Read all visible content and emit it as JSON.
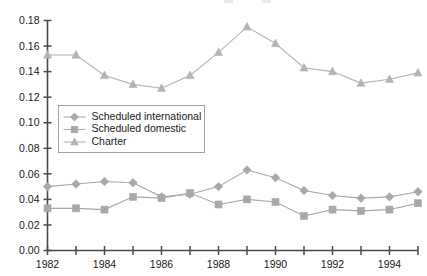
{
  "chart_data": {
    "type": "line",
    "title": "",
    "xlabel": "",
    "ylabel": "",
    "x": [
      1982,
      1983,
      1984,
      1985,
      1986,
      1987,
      1988,
      1989,
      1990,
      1991,
      1992,
      1993,
      1994,
      1995
    ],
    "xlim": [
      1982,
      1995
    ],
    "ylim": [
      0.0,
      0.18
    ],
    "ytick_labels": [
      "0.00",
      "0.02",
      "0.04",
      "0.06",
      "0.08",
      "0.10",
      "0.12",
      "0.14",
      "0.16",
      "0.18"
    ],
    "ytick_values": [
      0.0,
      0.02,
      0.04,
      0.06,
      0.08,
      0.1,
      0.12,
      0.14,
      0.16,
      0.18
    ],
    "xtick_values": [
      1982,
      1983,
      1984,
      1985,
      1986,
      1987,
      1988,
      1989,
      1990,
      1991,
      1992,
      1993,
      1994,
      1995
    ],
    "xtick_labels": [
      "1982",
      "",
      "1984",
      "",
      "1986",
      "",
      "1988",
      "",
      "1990",
      "",
      "1992",
      "",
      "1994",
      ""
    ],
    "grid": false,
    "legend_position": "center-left",
    "series": [
      {
        "name": "Scheduled international",
        "marker": "diamond",
        "color": "#a8a8a8",
        "values": [
          0.05,
          0.052,
          0.054,
          0.053,
          0.042,
          0.044,
          0.05,
          0.063,
          0.057,
          0.047,
          0.043,
          0.041,
          0.042,
          0.046
        ]
      },
      {
        "name": "Scheduled domestic",
        "marker": "square",
        "color": "#a8a8a8",
        "values": [
          0.033,
          0.033,
          0.032,
          0.042,
          0.041,
          0.045,
          0.036,
          0.04,
          0.038,
          0.027,
          0.032,
          0.031,
          0.032,
          0.037
        ]
      },
      {
        "name": "Charter",
        "marker": "triangle",
        "color": "#b4b4b4",
        "values": [
          0.153,
          0.153,
          0.137,
          0.13,
          0.127,
          0.137,
          0.155,
          0.175,
          0.162,
          0.143,
          0.14,
          0.131,
          0.134,
          0.139
        ]
      }
    ]
  },
  "legend": {
    "entries": [
      {
        "label": "Scheduled international"
      },
      {
        "label": "Scheduled domestic"
      },
      {
        "label": "Charter"
      }
    ]
  },
  "colors": {
    "axis": "#4a4a4a",
    "text": "#1a1a1a",
    "series_gray": "#a8a8a8",
    "charter_gray": "#b4b4b4",
    "background": "#ffffff"
  }
}
